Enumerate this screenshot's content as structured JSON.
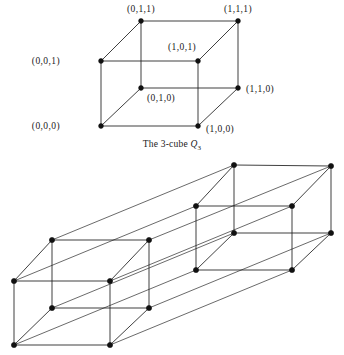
{
  "figure": {
    "caption_prefix": "The 3-cube ",
    "caption_symbol": "Q",
    "caption_subscript": "3"
  },
  "cube3": {
    "vertices": [
      {
        "id": "v000",
        "label": "(0,0,0)",
        "x": 101,
        "y": 126,
        "label_x": 60,
        "label_y": 129,
        "anchor": "end"
      },
      {
        "id": "v100",
        "label": "(1,0,0)",
        "x": 198,
        "y": 126,
        "label_x": 206,
        "label_y": 132,
        "anchor": "start"
      },
      {
        "id": "v010",
        "label": "(0,1,0)",
        "x": 141,
        "y": 88,
        "label_x": 147,
        "label_y": 101,
        "anchor": "start"
      },
      {
        "id": "v110",
        "label": "(1,1,0)",
        "x": 238,
        "y": 88,
        "label_x": 246,
        "label_y": 92,
        "anchor": "start"
      },
      {
        "id": "v001",
        "label": "(0,0,1)",
        "x": 101,
        "y": 61,
        "label_x": 60,
        "label_y": 64,
        "anchor": "end"
      },
      {
        "id": "v101",
        "label": "(1,0,1)",
        "x": 198,
        "y": 61,
        "label_x": 168,
        "label_y": 50,
        "anchor": "start"
      },
      {
        "id": "v011",
        "label": "(0,1,1)",
        "x": 141,
        "y": 21,
        "label_x": 141,
        "label_y": 12,
        "anchor": "middle"
      },
      {
        "id": "v111",
        "label": "(1,1,1)",
        "x": 238,
        "y": 21,
        "label_x": 238,
        "label_y": 12,
        "anchor": "middle"
      }
    ],
    "edges": [
      [
        "v000",
        "v100"
      ],
      [
        "v000",
        "v001"
      ],
      [
        "v000",
        "v010"
      ],
      [
        "v100",
        "v101"
      ],
      [
        "v100",
        "v110"
      ],
      [
        "v010",
        "v110"
      ],
      [
        "v010",
        "v011"
      ],
      [
        "v110",
        "v111"
      ],
      [
        "v001",
        "v101"
      ],
      [
        "v001",
        "v011"
      ],
      [
        "v101",
        "v111"
      ],
      [
        "v011",
        "v111"
      ]
    ]
  },
  "cube4": {
    "vertices": [
      {
        "id": "a000",
        "x": 14,
        "y": 345
      },
      {
        "id": "a100",
        "x": 110,
        "y": 345
      },
      {
        "id": "a010",
        "x": 52,
        "y": 308
      },
      {
        "id": "a110",
        "x": 149,
        "y": 308
      },
      {
        "id": "a001",
        "x": 14,
        "y": 281
      },
      {
        "id": "a101",
        "x": 110,
        "y": 281
      },
      {
        "id": "a011",
        "x": 52,
        "y": 240
      },
      {
        "id": "a111",
        "x": 149,
        "y": 240
      },
      {
        "id": "b000",
        "x": 196,
        "y": 270
      },
      {
        "id": "b100",
        "x": 292,
        "y": 270
      },
      {
        "id": "b010",
        "x": 234,
        "y": 233
      },
      {
        "id": "b110",
        "x": 331,
        "y": 233
      },
      {
        "id": "b001",
        "x": 196,
        "y": 206
      },
      {
        "id": "b101",
        "x": 292,
        "y": 206
      },
      {
        "id": "b011",
        "x": 234,
        "y": 165
      },
      {
        "id": "b111",
        "x": 331,
        "y": 166
      }
    ],
    "inner_edges": [
      [
        "a000",
        "a100"
      ],
      [
        "a000",
        "a001"
      ],
      [
        "a000",
        "a010"
      ],
      [
        "a100",
        "a101"
      ],
      [
        "a100",
        "a110"
      ],
      [
        "a010",
        "a110"
      ],
      [
        "a010",
        "a011"
      ],
      [
        "a110",
        "a111"
      ],
      [
        "a001",
        "a101"
      ],
      [
        "a001",
        "a011"
      ],
      [
        "a101",
        "a111"
      ],
      [
        "a011",
        "a111"
      ],
      [
        "b000",
        "b100"
      ],
      [
        "b000",
        "b001"
      ],
      [
        "b000",
        "b010"
      ],
      [
        "b100",
        "b101"
      ],
      [
        "b100",
        "b110"
      ],
      [
        "b010",
        "b110"
      ],
      [
        "b010",
        "b011"
      ],
      [
        "b110",
        "b111"
      ],
      [
        "b001",
        "b101"
      ],
      [
        "b001",
        "b011"
      ],
      [
        "b101",
        "b111"
      ],
      [
        "b011",
        "b111"
      ]
    ],
    "connecting_edges": [
      [
        "a000",
        "b000"
      ],
      [
        "a100",
        "b100"
      ],
      [
        "a010",
        "b010"
      ],
      [
        "a110",
        "b110"
      ],
      [
        "a001",
        "b001"
      ],
      [
        "a101",
        "b101"
      ],
      [
        "a011",
        "b011"
      ],
      [
        "a111",
        "b111"
      ]
    ]
  }
}
